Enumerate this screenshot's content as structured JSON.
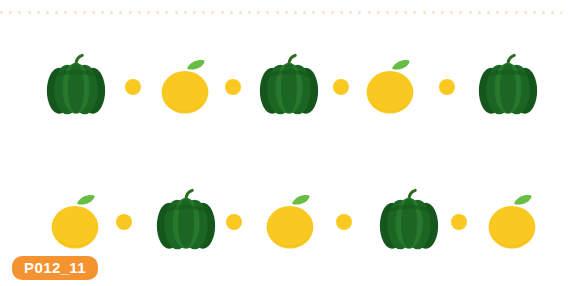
{
  "page": {
    "background_color": "#ffffff",
    "width": 570,
    "height": 286
  },
  "top_rule": {
    "style": "dotted",
    "dot_color": "#f6e3c0",
    "dot_count": 62,
    "dot_size_px": 3
  },
  "palette": {
    "pepper_green_dark": "#14561c",
    "pepper_green_mid": "#1b6623",
    "pepper_green_light": "#27782c",
    "stem_green": "#2f6b1f",
    "citrus_yellow": "#f9c922",
    "citrus_yellow_deep": "#f0b814",
    "leaf_green": "#68bd45",
    "dot_yellow": "#f9c922",
    "badge_orange": "#f59331",
    "badge_text": "#ffffff"
  },
  "rows": [
    {
      "row_label": "row-1",
      "items": [
        {
          "type": "pepper",
          "name": "green-bell-pepper",
          "size": 62
        },
        {
          "type": "dot",
          "name": "yellow-dot",
          "size": 16
        },
        {
          "type": "citrus",
          "name": "orange-citrus",
          "size": 52
        },
        {
          "type": "dot",
          "name": "yellow-dot",
          "size": 16
        },
        {
          "type": "pepper",
          "name": "green-bell-pepper",
          "size": 62
        },
        {
          "type": "dot",
          "name": "yellow-dot",
          "size": 16
        },
        {
          "type": "citrus",
          "name": "orange-citrus",
          "size": 52
        },
        {
          "type": "dot",
          "name": "yellow-dot",
          "size": 16
        },
        {
          "type": "pepper",
          "name": "green-bell-pepper",
          "size": 62
        }
      ]
    },
    {
      "row_label": "row-2",
      "items": [
        {
          "type": "citrus",
          "name": "orange-citrus",
          "size": 52
        },
        {
          "type": "dot",
          "name": "yellow-dot",
          "size": 16
        },
        {
          "type": "pepper",
          "name": "green-bell-pepper",
          "size": 62
        },
        {
          "type": "dot",
          "name": "yellow-dot",
          "size": 16
        },
        {
          "type": "citrus",
          "name": "orange-citrus",
          "size": 52
        },
        {
          "type": "dot",
          "name": "yellow-dot",
          "size": 16
        },
        {
          "type": "pepper",
          "name": "green-bell-pepper",
          "size": 62
        },
        {
          "type": "dot",
          "name": "yellow-dot",
          "size": 16
        },
        {
          "type": "citrus",
          "name": "orange-citrus",
          "size": 52
        }
      ]
    }
  ],
  "badge": {
    "label": "P012_11"
  }
}
